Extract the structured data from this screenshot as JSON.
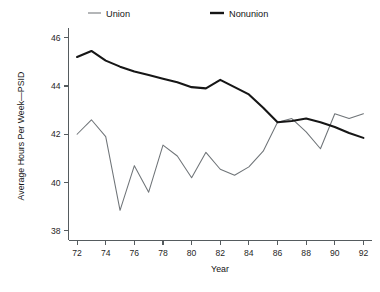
{
  "chart_data": {
    "type": "line",
    "title": "",
    "xlabel": "Year",
    "ylabel": "Average Hours Per Week—PSID",
    "xlim": [
      71.4,
      92.6
    ],
    "ylim": [
      37.6,
      46.4
    ],
    "xticks": [
      72,
      74,
      76,
      78,
      80,
      82,
      84,
      86,
      88,
      90,
      92
    ],
    "xtick_labels": [
      "72",
      "74",
      "76",
      "78",
      "80",
      "82",
      "84",
      "86",
      "88",
      "90",
      "92"
    ],
    "yticks": [
      38,
      40,
      42,
      44,
      46
    ],
    "ytick_labels": [
      "38",
      "40",
      "42",
      "44",
      "46"
    ],
    "grid": false,
    "legend_position": "top",
    "x": [
      72,
      73,
      74,
      75,
      76,
      77,
      78,
      79,
      80,
      81,
      82,
      83,
      84,
      85,
      86,
      87,
      88,
      89,
      90,
      91,
      92
    ],
    "series": [
      {
        "name": "Union",
        "style": "thin",
        "color": "#6f7478",
        "values": [
          42.0,
          42.6,
          41.9,
          38.85,
          40.7,
          39.6,
          41.55,
          41.1,
          40.2,
          41.25,
          40.55,
          40.3,
          40.65,
          41.3,
          42.5,
          42.65,
          42.1,
          41.4,
          42.85,
          42.65,
          42.85
        ]
      },
      {
        "name": "Nonunion",
        "style": "thick",
        "color": "#161616",
        "values": [
          45.2,
          45.45,
          45.05,
          44.8,
          44.6,
          44.45,
          44.3,
          44.15,
          43.95,
          43.9,
          44.25,
          43.95,
          43.65,
          43.1,
          42.5,
          42.55,
          42.65,
          42.5,
          42.3,
          42.05,
          41.85
        ]
      }
    ],
    "legend": [
      {
        "label": "Union",
        "style": "thin"
      },
      {
        "label": "Nonunion",
        "style": "thick"
      }
    ]
  }
}
